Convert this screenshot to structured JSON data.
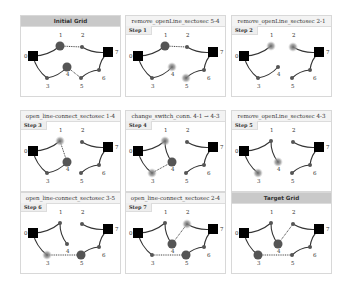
{
  "panels": [
    {
      "title": "Initial Grid",
      "step": null,
      "grey": true,
      "big": [
        1,
        4
      ],
      "glow": [],
      "solid": [
        [
          0,
          1
        ],
        [
          2,
          7
        ],
        [
          7,
          6
        ],
        [
          6,
          5
        ],
        [
          0,
          3
        ],
        [
          3,
          4
        ]
      ],
      "dashed": [
        [
          1,
          2
        ],
        [
          4,
          5
        ]
      ]
    },
    {
      "title": "remove_openLine_sectosec 5-4",
      "step": "Step 1",
      "grey": false,
      "big": [
        1
      ],
      "glow": [
        4,
        5
      ],
      "solid": [
        [
          0,
          1
        ],
        [
          2,
          7
        ],
        [
          7,
          6
        ],
        [
          6,
          5
        ],
        [
          0,
          3
        ],
        [
          3,
          4
        ]
      ],
      "dashed": [
        [
          1,
          2
        ]
      ]
    },
    {
      "title": "remove_openLine_sectosec 2-1",
      "step": "Step 2",
      "grey": false,
      "big": [],
      "glow": [
        1,
        2
      ],
      "solid": [
        [
          0,
          1
        ],
        [
          2,
          7
        ],
        [
          7,
          6
        ],
        [
          6,
          5
        ],
        [
          0,
          3
        ],
        [
          3,
          4
        ]
      ],
      "dashed": []
    },
    {
      "title": "open_line-connect_sectosec 1-4",
      "step": "Step 3",
      "grey": false,
      "big": [
        4
      ],
      "glow": [
        1
      ],
      "solid": [
        [
          0,
          1
        ],
        [
          2,
          7
        ],
        [
          7,
          6
        ],
        [
          6,
          5
        ],
        [
          0,
          3
        ],
        [
          3,
          4
        ]
      ],
      "dashed": [
        [
          1,
          4
        ]
      ]
    },
    {
      "title": "change_switch_conn. 4-1 → 4-3",
      "step": "Step 4",
      "grey": false,
      "big": [
        4
      ],
      "glow": [
        1,
        3
      ],
      "solid": [
        [
          0,
          1
        ],
        [
          1,
          4
        ],
        [
          2,
          7
        ],
        [
          7,
          6
        ],
        [
          6,
          5
        ],
        [
          0,
          3
        ]
      ],
      "dashed": [
        [
          3,
          4
        ]
      ]
    },
    {
      "title": "remove_openLine_sectosec 4-3",
      "step": "Step 5",
      "grey": false,
      "big": [],
      "glow": [
        4,
        3
      ],
      "solid": [
        [
          0,
          1
        ],
        [
          1,
          4
        ],
        [
          2,
          7
        ],
        [
          7,
          6
        ],
        [
          6,
          5
        ],
        [
          0,
          3
        ]
      ],
      "dashed": []
    },
    {
      "title": "open_line-connect_sectosec 3-5",
      "step": "Step 6",
      "grey": false,
      "big": [
        5
      ],
      "glow": [
        3
      ],
      "solid": [
        [
          0,
          1
        ],
        [
          1,
          4
        ],
        [
          2,
          7
        ],
        [
          7,
          6
        ],
        [
          6,
          5
        ],
        [
          0,
          3
        ]
      ],
      "dashed": [
        [
          3,
          5
        ]
      ]
    },
    {
      "title": "open_line-connect_sectosec 2-4",
      "step": "Step 7",
      "grey": false,
      "big": [
        4,
        5
      ],
      "glow": [
        2
      ],
      "solid": [
        [
          0,
          1
        ],
        [
          1,
          4
        ],
        [
          2,
          7
        ],
        [
          7,
          6
        ],
        [
          6,
          5
        ],
        [
          0,
          3
        ]
      ],
      "dashed": [
        [
          3,
          5
        ],
        [
          2,
          4
        ]
      ]
    },
    {
      "title": "Target Grid",
      "step": null,
      "grey": true,
      "big": [
        3,
        4
      ],
      "glow": [],
      "solid": [
        [
          0,
          1
        ],
        [
          1,
          4
        ],
        [
          2,
          7
        ],
        [
          7,
          6
        ],
        [
          6,
          5
        ],
        [
          0,
          3
        ]
      ],
      "dashed": [
        [
          3,
          5
        ],
        [
          2,
          4
        ]
      ]
    }
  ],
  "nodes": {
    "0": {
      "x": 12,
      "y": 30,
      "label": "0",
      "lx": 3,
      "ly": 32,
      "type": "square"
    },
    "1": {
      "x": 39,
      "y": 20,
      "label": "1",
      "lx": 38,
      "ly": 11,
      "type": "dot"
    },
    "2": {
      "x": 61,
      "y": 21,
      "label": "2",
      "lx": 60,
      "ly": 11,
      "type": "dot"
    },
    "3": {
      "x": 26,
      "y": 52,
      "label": "3",
      "lx": 25,
      "ly": 62,
      "type": "dot"
    },
    "4": {
      "x": 46,
      "y": 41,
      "label": "4",
      "lx": 45,
      "ly": 50,
      "type": "dot"
    },
    "5": {
      "x": 60,
      "y": 52,
      "label": "5",
      "lx": 59,
      "ly": 62,
      "type": "dot"
    },
    "6": {
      "x": 78,
      "y": 44,
      "label": "6",
      "lx": 81,
      "ly": 54,
      "type": "dot"
    },
    "7": {
      "x": 87,
      "y": 26,
      "label": "7",
      "lx": 94,
      "ly": 28,
      "type": "square"
    }
  }
}
